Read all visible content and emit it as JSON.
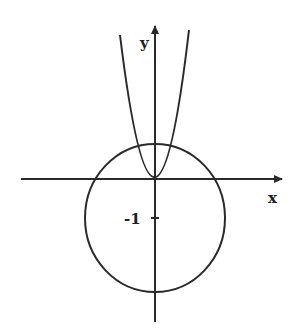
{
  "figure": {
    "axes": {
      "x_label": "x",
      "y_label": "y",
      "tick_labels": [
        {
          "axis": "y",
          "value": -1,
          "label": "-1"
        }
      ]
    },
    "curves": [
      {
        "name": "parabola",
        "type": "parabola",
        "vertex": [
          0,
          0
        ],
        "opens": "up"
      },
      {
        "name": "circle",
        "type": "circle",
        "center": [
          0,
          -1
        ],
        "note": "passes above the origin, intersects parabola at two points"
      }
    ],
    "colors": {
      "stroke": "#2a2a2a",
      "background": "#ffffff"
    }
  }
}
